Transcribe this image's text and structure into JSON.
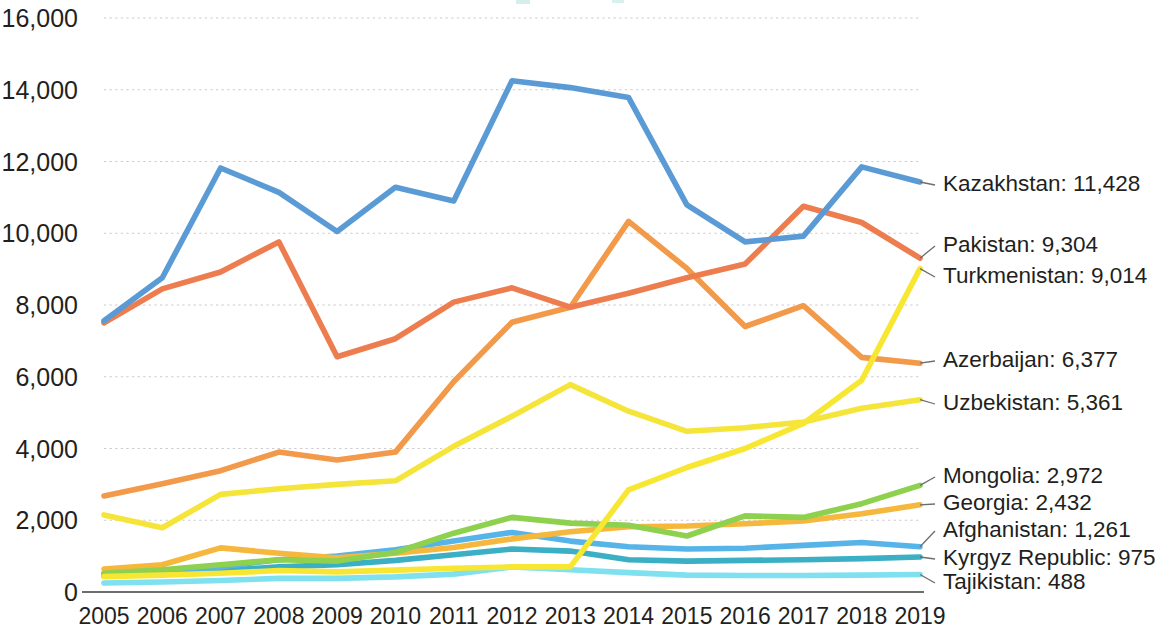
{
  "chart_data": {
    "type": "line",
    "title": "",
    "subtitle": "",
    "xlabel": "",
    "ylabel": "",
    "grid": true,
    "legend_position": "right-end-labels",
    "xlim": [
      2005,
      2019
    ],
    "ylim": [
      0,
      16000
    ],
    "y_ticks": [
      "0",
      "2,000",
      "4,000",
      "6,000",
      "8,000",
      "10,000",
      "12,000",
      "14,000",
      "16,000"
    ],
    "y_tick_values": [
      0,
      2000,
      4000,
      6000,
      8000,
      10000,
      12000,
      14000,
      16000
    ],
    "categories": [
      "2005",
      "2006",
      "2007",
      "2008",
      "2009",
      "2010",
      "2011",
      "2012",
      "2013",
      "2014",
      "2015",
      "2016",
      "2017",
      "2018",
      "2019"
    ],
    "series": [
      {
        "name": "Kazakhstan",
        "end_label": "Kazakhstan: 11,428",
        "end_value": 11428,
        "color": "#5B9BD5",
        "values": [
          7560,
          8760,
          11820,
          11140,
          10050,
          11280,
          10900,
          14250,
          14060,
          13780,
          10790,
          9760,
          9920,
          11850,
          11428
        ]
      },
      {
        "name": "Pakistan",
        "end_label": "Pakistan: 9,304",
        "end_value": 9304,
        "color": "#ED7D4E",
        "values": [
          7500,
          8450,
          8920,
          9760,
          6560,
          7060,
          8080,
          8480,
          7940,
          8330,
          8760,
          9140,
          10750,
          10300,
          9304
        ]
      },
      {
        "name": "Turkmenistan",
        "end_label": "Turkmenistan: 9,014",
        "end_value": 9014,
        "color": "#F7E733",
        "values": [
          430,
          470,
          520,
          600,
          560,
          610,
          660,
          700,
          700,
          2850,
          3470,
          4000,
          4700,
          5900,
          9014
        ]
      },
      {
        "name": "Azerbaijan",
        "end_label": "Azerbaijan: 6,377",
        "end_value": 6377,
        "color": "#F2994A",
        "values": [
          2680,
          3020,
          3380,
          3900,
          3680,
          3900,
          5860,
          7520,
          7940,
          10330,
          9020,
          7400,
          7980,
          6540,
          6377
        ]
      },
      {
        "name": "Uzbekistan",
        "end_label": "Uzbekistan: 5,361",
        "end_value": 5361,
        "color": "#F5E53B",
        "values": [
          2150,
          1790,
          2720,
          2880,
          3000,
          3100,
          4060,
          4900,
          5780,
          5040,
          4480,
          4580,
          4740,
          5120,
          5361
        ]
      },
      {
        "name": "Mongolia",
        "end_label": "Mongolia: 2,972",
        "end_value": 2972,
        "color": "#8DD14F",
        "values": [
          520,
          620,
          760,
          900,
          860,
          1100,
          1640,
          2080,
          1920,
          1860,
          1560,
          2120,
          2080,
          2460,
          2972
        ]
      },
      {
        "name": "Georgia",
        "end_label": "Georgia: 2,432",
        "end_value": 2432,
        "color": "#F5B83D",
        "values": [
          640,
          760,
          1230,
          1080,
          950,
          1080,
          1240,
          1480,
          1680,
          1820,
          1840,
          1900,
          1980,
          2180,
          2432
        ]
      },
      {
        "name": "Afghanistan",
        "end_label": "Afghanistan: 1,261",
        "end_value": 1261,
        "color": "#56B4E8"
      },
      {
        "name": "Kyrgyz Republic",
        "end_label": "Kyrgyz Republic: 975",
        "end_value": 975,
        "color": "#3BAFC4",
        "values": [
          440,
          500,
          600,
          700,
          760,
          880,
          1040,
          1200,
          1140,
          900,
          860,
          880,
          900,
          930,
          975
        ]
      },
      {
        "name": "Tajikistan",
        "end_label": "Tajikistan: 488",
        "end_value": 488,
        "color": "#7FE0EF",
        "values": [
          250,
          280,
          320,
          380,
          380,
          420,
          500,
          700,
          620,
          540,
          470,
          460,
          460,
          470,
          488
        ]
      }
    ]
  },
  "afghanistan_values": [
    500,
    560,
    700,
    900,
    1000,
    1180,
    1420,
    1660,
    1420,
    1260,
    1200,
    1220,
    1300,
    1380,
    1261
  ]
}
